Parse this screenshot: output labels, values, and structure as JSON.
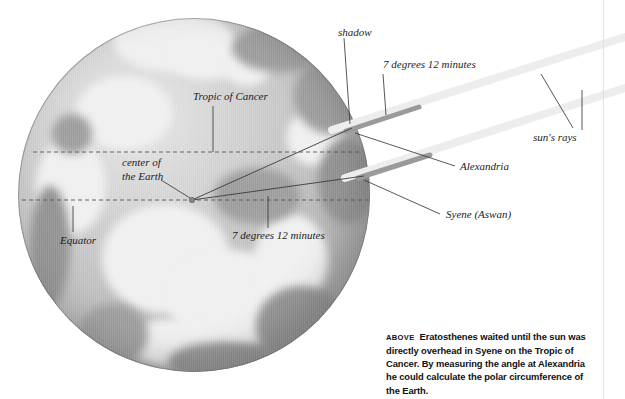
{
  "figure": {
    "type": "diagram",
    "globe": {
      "name": "earth-globe"
    }
  },
  "labels": {
    "tropic_of_cancer": "Tropic of Cancer",
    "center_of_the_earth_line1": "center of",
    "center_of_the_earth_line2": "the Earth",
    "equator": "Equator",
    "angle_inner": "7 degrees 12 minutes",
    "angle_outer": "7 degrees 12 minutes",
    "shadow": "shadow",
    "suns_rays": "sun's rays",
    "alexandria": "Alexandria",
    "syene": "Syene (Aswan)"
  },
  "caption": {
    "kicker": "ABOVE",
    "text": "Eratosthenes waited until the sun was directly overhead in Syene on the Tropic of Cancer. By measuring the angle at Alexandria he could calculate the polar circumference of the Earth."
  },
  "colors": {
    "ray_bar": "#9a9a9a",
    "ray_beam": "#ededed",
    "leader_line": "#3a3a3a",
    "dashed_latitude": "#555555",
    "globe_mid": "#bdbdbd",
    "text": "#1c1c1c"
  },
  "geometry": {
    "center_of_earth_point": [
      192,
      200
    ],
    "alexandria_point": [
      352,
      128
    ],
    "syene_point": [
      363,
      176
    ],
    "equator_y": 200,
    "tropic_y": 152
  }
}
